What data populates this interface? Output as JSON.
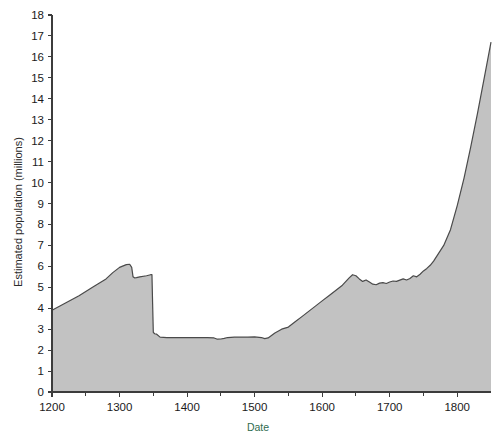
{
  "chart_data": {
    "type": "area",
    "title": "",
    "xlabel": "Date",
    "ylabel": "Estimated population (millions)",
    "xlim": [
      1200,
      1850
    ],
    "ylim": [
      0,
      18
    ],
    "grid": false,
    "legend": "none",
    "series_name": "Estimated population",
    "fill_color": "#c2c2c2",
    "line_color": "#4a4a4a",
    "xticks": [
      1200,
      1300,
      1400,
      1500,
      1600,
      1700,
      1800
    ],
    "xtick_labels": [
      "1200",
      "1300",
      "1400",
      "1500",
      "1600",
      "1700",
      "1800"
    ],
    "yticks": [
      0,
      1,
      2,
      3,
      4,
      5,
      6,
      7,
      8,
      9,
      10,
      11,
      12,
      13,
      14,
      15,
      16,
      17,
      18
    ],
    "ytick_labels": [
      "0",
      "1",
      "2",
      "3",
      "4",
      "5",
      "6",
      "7",
      "8",
      "9",
      "10",
      "11",
      "12",
      "13",
      "14",
      "15",
      "16",
      "17",
      "18"
    ],
    "x": [
      1200,
      1220,
      1240,
      1260,
      1280,
      1290,
      1300,
      1310,
      1315,
      1318,
      1320,
      1322,
      1325,
      1330,
      1340,
      1346,
      1348,
      1349,
      1350,
      1352,
      1355,
      1360,
      1370,
      1380,
      1390,
      1400,
      1410,
      1420,
      1430,
      1440,
      1445,
      1450,
      1455,
      1460,
      1470,
      1480,
      1490,
      1500,
      1510,
      1515,
      1520,
      1525,
      1530,
      1540,
      1550,
      1560,
      1570,
      1580,
      1590,
      1600,
      1610,
      1620,
      1630,
      1640,
      1645,
      1650,
      1655,
      1660,
      1665,
      1670,
      1675,
      1680,
      1685,
      1690,
      1695,
      1700,
      1705,
      1710,
      1715,
      1720,
      1725,
      1730,
      1735,
      1740,
      1745,
      1750,
      1755,
      1760,
      1765,
      1770,
      1780,
      1790,
      1800,
      1810,
      1820,
      1830,
      1840,
      1850
    ],
    "y": [
      3.9,
      4.25,
      4.6,
      5.0,
      5.4,
      5.7,
      5.95,
      6.08,
      6.1,
      5.95,
      5.5,
      5.45,
      5.46,
      5.5,
      5.55,
      5.6,
      5.6,
      4.2,
      2.85,
      2.78,
      2.76,
      2.62,
      2.6,
      2.6,
      2.6,
      2.6,
      2.6,
      2.6,
      2.6,
      2.58,
      2.52,
      2.53,
      2.56,
      2.6,
      2.62,
      2.62,
      2.62,
      2.63,
      2.6,
      2.55,
      2.58,
      2.7,
      2.82,
      3.0,
      3.1,
      3.35,
      3.6,
      3.85,
      4.1,
      4.35,
      4.6,
      4.85,
      5.1,
      5.45,
      5.6,
      5.55,
      5.4,
      5.28,
      5.35,
      5.25,
      5.15,
      5.12,
      5.2,
      5.22,
      5.18,
      5.25,
      5.3,
      5.28,
      5.34,
      5.4,
      5.35,
      5.42,
      5.55,
      5.5,
      5.62,
      5.78,
      5.9,
      6.05,
      6.25,
      6.5,
      7.0,
      7.75,
      8.9,
      10.2,
      11.7,
      13.3,
      15.0,
      16.7
    ],
    "annotations": [
      {
        "label": "peak before plague",
        "x": 1315,
        "y": 6.1
      },
      {
        "label": "Black Death collapse",
        "x": 1350,
        "y": 2.85
      },
      {
        "label": "late-medieval trough",
        "x": 1450,
        "y": 2.52
      },
      {
        "label": "mid-17th-century plateau",
        "x": 1645,
        "y": 5.6
      },
      {
        "label": "industrial-era rise",
        "x": 1850,
        "y": 16.7
      }
    ]
  },
  "axes": {
    "y_title": "Estimated population (millions)",
    "x_title": "Date"
  }
}
